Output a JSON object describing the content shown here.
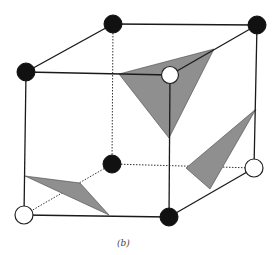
{
  "figure": {
    "caption": "(b)",
    "colors": {
      "black_atom": "#111111",
      "white_atom": "#ffffff",
      "plane_fill": "#8f8f8f",
      "edge": "#1a1a1a"
    },
    "vertices": {
      "front_top_left": {
        "x": 26,
        "y": 72,
        "type": "black"
      },
      "front_top_right": {
        "x": 170,
        "y": 75,
        "type": "white"
      },
      "front_bottom_left": {
        "x": 24,
        "y": 215,
        "type": "white"
      },
      "front_bottom_right": {
        "x": 169,
        "y": 217,
        "type": "black"
      },
      "back_top_left": {
        "x": 113,
        "y": 24,
        "type": "black"
      },
      "back_top_right": {
        "x": 257,
        "y": 25,
        "type": "black"
      },
      "back_bottom_left": {
        "x": 112,
        "y": 164,
        "type": "black"
      },
      "back_bottom_right": {
        "x": 254,
        "y": 168,
        "type": "white"
      }
    },
    "planes": [
      {
        "name": "upper-plane",
        "points": "119,74 214,49 169,138"
      },
      {
        "name": "right-plane",
        "points": "256,109 186,168 210,189"
      },
      {
        "name": "left-plane",
        "points": "25,176 80,183 109,215"
      }
    ]
  }
}
